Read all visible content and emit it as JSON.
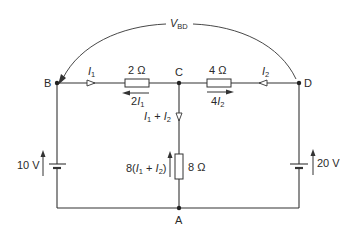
{
  "diagram": {
    "type": "circuit",
    "nodes": {
      "B": "B",
      "C": "C",
      "D": "D",
      "A": "A"
    },
    "voltage_label": {
      "main": "V",
      "sub": "BD"
    },
    "resistors": [
      {
        "id": "r_bc",
        "value": "2 Ω",
        "drop_label_pre": "2",
        "drop_label_var": "I",
        "drop_label_sub": "1",
        "drop_direction": "left"
      },
      {
        "id": "r_cd",
        "value": "4 Ω",
        "drop_label_pre": "4",
        "drop_label_var": "I",
        "drop_label_sub": "2",
        "drop_direction": "right"
      },
      {
        "id": "r_ca",
        "value": "8 Ω",
        "drop_label": "8(I₁ + I₂)",
        "drop_direction": "up"
      }
    ],
    "currents": [
      {
        "id": "i1",
        "var": "I",
        "sub": "1",
        "direction": "right"
      },
      {
        "id": "i2",
        "var": "I",
        "sub": "2",
        "direction": "left"
      },
      {
        "id": "i12",
        "label": "I₁ + I₂",
        "direction": "down"
      }
    ],
    "sources": [
      {
        "id": "v_left",
        "value": "10 V",
        "direction": "up"
      },
      {
        "id": "v_right",
        "value": "20 V",
        "direction": "up"
      }
    ],
    "drop_8": {
      "pre": "8(",
      "v1": "I",
      "s1": "1",
      "plus": " + ",
      "v2": "I",
      "s2": "2",
      "post": ")"
    },
    "sum_label": {
      "v1": "I",
      "s1": "1",
      "plus": " + ",
      "v2": "I",
      "s2": "2"
    }
  }
}
